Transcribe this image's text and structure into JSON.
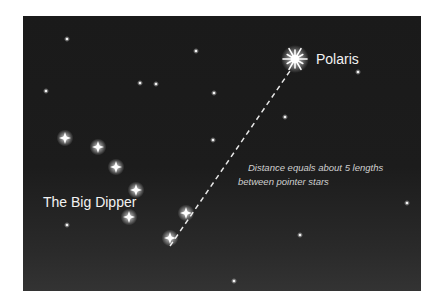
{
  "diagram": {
    "labels": {
      "polaris": "Polaris",
      "big_dipper": "The Big Dipper",
      "note_line1": "Distance equals about 5 lengths",
      "note_line2": "between pointer stars"
    },
    "colors": {
      "sky_top": "#1a1a1a",
      "sky_bottom": "#333333",
      "star": "#ffffff",
      "label": "#f2f2f2",
      "note": "#cfcfcf",
      "dashed_line": "#e8e8e8"
    },
    "polaris": {
      "x": 295,
      "y": 59
    },
    "big_dipper_stars": [
      {
        "x": 65,
        "y": 138
      },
      {
        "x": 98,
        "y": 147
      },
      {
        "x": 116,
        "y": 167
      },
      {
        "x": 136,
        "y": 190
      },
      {
        "x": 129,
        "y": 217
      },
      {
        "x": 186,
        "y": 213
      },
      {
        "x": 170,
        "y": 238
      }
    ],
    "background_stars": [
      {
        "x": 67,
        "y": 39
      },
      {
        "x": 46,
        "y": 91
      },
      {
        "x": 140,
        "y": 83
      },
      {
        "x": 156,
        "y": 84
      },
      {
        "x": 196,
        "y": 51
      },
      {
        "x": 214,
        "y": 93
      },
      {
        "x": 213,
        "y": 140
      },
      {
        "x": 285,
        "y": 117
      },
      {
        "x": 358,
        "y": 72
      },
      {
        "x": 407,
        "y": 203
      },
      {
        "x": 300,
        "y": 235
      },
      {
        "x": 67,
        "y": 225
      },
      {
        "x": 234,
        "y": 281
      }
    ],
    "pointer_line": {
      "x1": 170,
      "y1": 246,
      "x2": 292,
      "y2": 68
    }
  }
}
